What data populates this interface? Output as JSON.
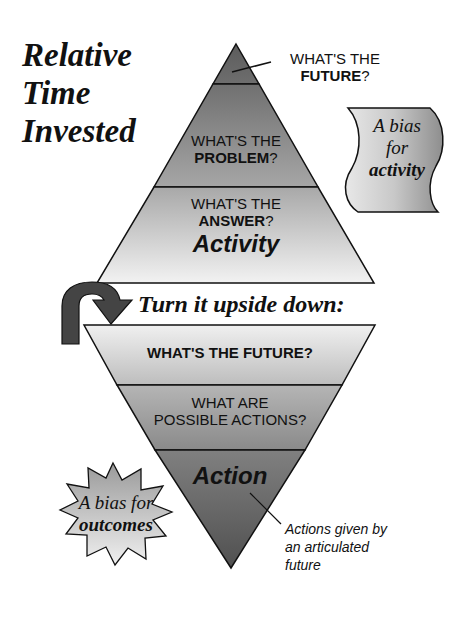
{
  "title": {
    "line1": "Relative",
    "line2": "Time",
    "line3": "Invested"
  },
  "top_pyramid": {
    "tier1_callout": {
      "line1": "WHAT'S THE",
      "line2_bold": "FUTURE",
      "line2_suffix": "?"
    },
    "tier2": {
      "line1": "WHAT'S THE",
      "line2_bold": "PROBLEM",
      "line2_suffix": "?"
    },
    "tier3": {
      "line1": "WHAT'S THE",
      "line2_bold": "ANSWER",
      "line2_suffix": "?",
      "label": "Activity"
    }
  },
  "banner": {
    "line1": "A bias",
    "line2": "for",
    "line3_bold": "activity"
  },
  "transition": {
    "text": "Turn it upside down:",
    "icon": "u-turn-arrow-icon"
  },
  "bottom_pyramid": {
    "tier1": {
      "text": "WHAT'S THE FUTURE?"
    },
    "tier2": {
      "line1": "WHAT ARE",
      "line2": "POSSIBLE ACTIONS?"
    },
    "tier3": {
      "label": "Action"
    },
    "callout": {
      "line1": "Actions given by",
      "line2": "an articulated",
      "line3": "future"
    }
  },
  "starburst": {
    "line1": "A bias for",
    "line2_bold": "outcomes"
  },
  "colors": {
    "dark": "#5a5a5a",
    "mid": "#8a8a8a",
    "light": "#d8d8d8",
    "stroke": "#111111"
  }
}
